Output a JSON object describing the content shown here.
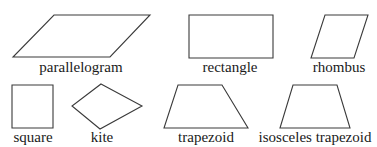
{
  "diagram": {
    "stroke_color": "#3a3a3a",
    "shapes": [
      {
        "id": "parallelogram",
        "label": "parallelogram",
        "points": "54,15 150,15 110,57 13,57",
        "label_x": 81,
        "label_y": 60
      },
      {
        "id": "rectangle",
        "label": "rectangle",
        "points": "189,15 273,15 273,58 189,58",
        "label_x": 230,
        "label_y": 60
      },
      {
        "id": "rhombus",
        "label": "rhombus",
        "points": "325,15 368,15 354,58 311,58",
        "label_x": 339,
        "label_y": 60
      },
      {
        "id": "square",
        "label": "square",
        "points": "12,85 53,85 53,128 12,128",
        "label_x": 33,
        "label_y": 130
      },
      {
        "id": "kite",
        "label": "kite",
        "points": "101,84 142,106 100,129 72,106",
        "label_x": 102,
        "label_y": 130
      },
      {
        "id": "trapezoid",
        "label": "trapezoid",
        "points": "178,85 222,85 248,128 164,128",
        "label_x": 206,
        "label_y": 130
      },
      {
        "id": "isosceles-trapezoid",
        "label": "isosceles trapezoid",
        "points": "293,85 337,85 350,128 280,128",
        "label_x": 315,
        "label_y": 130
      }
    ]
  }
}
